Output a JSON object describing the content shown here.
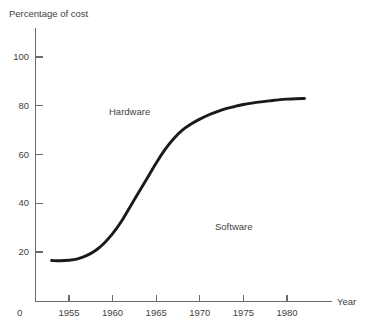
{
  "chart_data": {
    "type": "line",
    "title": "",
    "subtitle": "",
    "xlabel": "Year",
    "ylabel": "Percentage of cost",
    "xlim": [
      1952,
      1983.5
    ],
    "ylim": [
      0,
      110
    ],
    "grid": false,
    "legend": "none",
    "y_ticks": [
      20,
      40,
      60,
      80,
      100
    ],
    "y_tick_labels": [
      "20",
      "40",
      "60",
      "80",
      "100"
    ],
    "x_ticks": [
      1955,
      1960,
      1965,
      1970,
      1975,
      1980
    ],
    "x_tick_labels": [
      "1955",
      "1960",
      "1965",
      "1970",
      "1975",
      "1980"
    ],
    "origin_label": "0",
    "series": [
      {
        "name": "Hardware cost share",
        "color": "#1a1a1a",
        "x": [
          1953,
          1954,
          1955,
          1956,
          1957,
          1958,
          1959,
          1960,
          1961,
          1962,
          1963,
          1964,
          1965,
          1966,
          1967,
          1968,
          1969,
          1970,
          1971,
          1972,
          1973,
          1974,
          1975,
          1976,
          1977,
          1978,
          1979,
          1980,
          1981,
          1982
        ],
        "values": [
          16.5,
          16.4,
          16.6,
          17.2,
          18.5,
          20.5,
          23.5,
          27.5,
          32.5,
          38.5,
          44.5,
          50.5,
          56.5,
          62.0,
          66.5,
          70.0,
          72.5,
          74.5,
          76.2,
          77.6,
          78.8,
          79.7,
          80.5,
          81.1,
          81.6,
          82.0,
          82.4,
          82.7,
          82.9,
          83.0
        ]
      }
    ],
    "annotations": [
      {
        "text": "Hardware",
        "x": 1964,
        "y": 79,
        "region": "above-curve"
      },
      {
        "text": "Software",
        "x": 1974,
        "y": 32,
        "region": "below-curve"
      }
    ]
  },
  "labels": {
    "y_axis_title": "Percentage of cost",
    "x_axis_title": "Year",
    "origin": "0",
    "hardware": "Hardware",
    "software": "Software"
  },
  "colors": {
    "curve": "#1a1a1a",
    "axis": "#6b6b6b",
    "text": "#3f3f3f",
    "background": "#ffffff"
  }
}
